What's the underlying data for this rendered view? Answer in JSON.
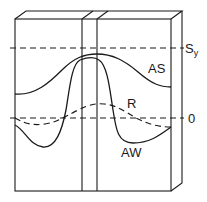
{
  "diagram": {
    "title": "",
    "labels": {
      "yield_strength": "S",
      "yield_strength_sub": "y",
      "zero": "0",
      "as_curve": "AS",
      "r_curve": "R",
      "aw_curve": "AW"
    },
    "curves": [
      {
        "name": "AS",
        "style": "solid",
        "description": "Stress profile, as-welded/stress-relieved upper curve peaking near Sy at weld center"
      },
      {
        "name": "R",
        "style": "dashed",
        "description": "Residual stress curve oscillating about zero"
      },
      {
        "name": "AW",
        "style": "solid",
        "description": "As-welded stress curve dipping below zero at edges and peaking near Sy at center"
      }
    ],
    "reference_lines": [
      {
        "name": "Sy",
        "style": "dashed"
      },
      {
        "name": "0",
        "style": "dashed"
      }
    ],
    "colors": {
      "line": "#1a1a1a",
      "background": "#ffffff"
    }
  }
}
